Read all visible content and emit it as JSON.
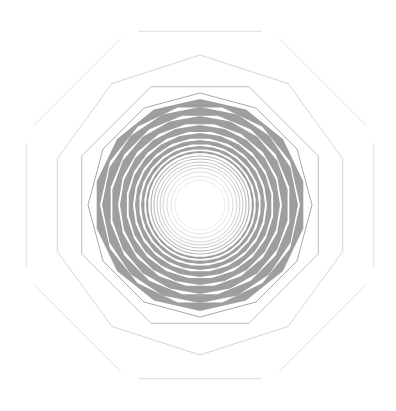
{
  "canvas": {
    "width": 396,
    "height": 411,
    "background": "#ffffff"
  },
  "center": {
    "x": 200,
    "y": 205
  },
  "colors": {
    "outer_line": "#dddddd",
    "mid_line": "#cccccc",
    "dark_line": "#a8a8a8",
    "band_fill": "#9e9e9e",
    "inner_ring": "#c8c8c8",
    "core_ring": "#e6e6e6"
  },
  "outlines": [
    {
      "name": "outer-octagon",
      "sides": 8,
      "radius": 188,
      "rotation": 22.5,
      "stroke": "#dedede",
      "width": 1,
      "gap": true
    },
    {
      "name": "decagon",
      "sides": 10,
      "radius": 150,
      "rotation": 0,
      "stroke": "#d6d6d6",
      "width": 1,
      "gap": false
    },
    {
      "name": "middle-octagon",
      "sides": 8,
      "radius": 128,
      "rotation": 22.5,
      "stroke": "#bdbdbd",
      "width": 1,
      "gap": false
    },
    {
      "name": "dodecagon",
      "sides": 12,
      "radius": 112,
      "rotation": 0,
      "stroke": "#a8a8a8",
      "width": 1,
      "gap": false
    }
  ],
  "bands": [
    {
      "sides": 14,
      "outer": 106,
      "inner": 100
    },
    {
      "sides": 16,
      "outer": 98,
      "inner": 91
    },
    {
      "sides": 18,
      "outer": 89,
      "inner": 82
    },
    {
      "sides": 20,
      "outer": 80,
      "inner": 74
    },
    {
      "sides": 22,
      "outer": 72,
      "inner": 67
    },
    {
      "sides": 24,
      "outer": 65,
      "inner": 61
    },
    {
      "sides": 28,
      "outer": 59,
      "inner": 56
    },
    {
      "sides": 32,
      "outer": 54,
      "inner": 52
    }
  ],
  "rings": [
    {
      "r": 49,
      "stroke": "#b4b4b4",
      "width": 1.2
    },
    {
      "r": 46,
      "stroke": "#bcbcbc",
      "width": 1.1
    },
    {
      "r": 43,
      "stroke": "#c4c4c4",
      "width": 1
    },
    {
      "r": 40,
      "stroke": "#cccccc",
      "width": 1
    },
    {
      "r": 37,
      "stroke": "#d4d4d4",
      "width": 1
    },
    {
      "r": 33,
      "stroke": "#dcdcdc",
      "width": 1
    },
    {
      "r": 29,
      "stroke": "#e4e4e4",
      "width": 1
    },
    {
      "r": 25,
      "stroke": "#ececec",
      "width": 1
    }
  ]
}
